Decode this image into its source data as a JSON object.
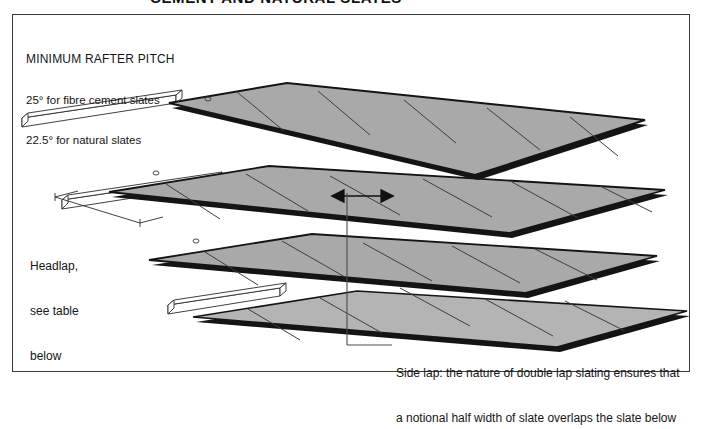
{
  "figure": {
    "heading": "CEMENT AND NATURAL SLATES",
    "pitch_note": {
      "line1": "MINIMUM RAFTER PITCH",
      "line2": "25° for fibre cement slates",
      "line3": "22.5° for natural slates"
    },
    "headlap_label": {
      "line1": "Headlap,",
      "line2": "see table",
      "line3": "below"
    },
    "sidelap_caption": {
      "line1": "Side lap: the nature of double lap slating ensures that",
      "line2": "a notional half width of slate overlaps the slate below"
    },
    "colors": {
      "slate_fill": "#a9a9a9",
      "slate_fill_light": "#b4b4b4",
      "slate_edge": "#141414",
      "joint_line": "#3d3d3d",
      "batten_fill": "#ffffff",
      "batten_line": "#2b2b2b",
      "frame": "#3a3a3a",
      "text": "#151515"
    },
    "elements": {
      "courses": 4,
      "battens": 3,
      "arrow_label": "side-lap-arrow"
    }
  }
}
